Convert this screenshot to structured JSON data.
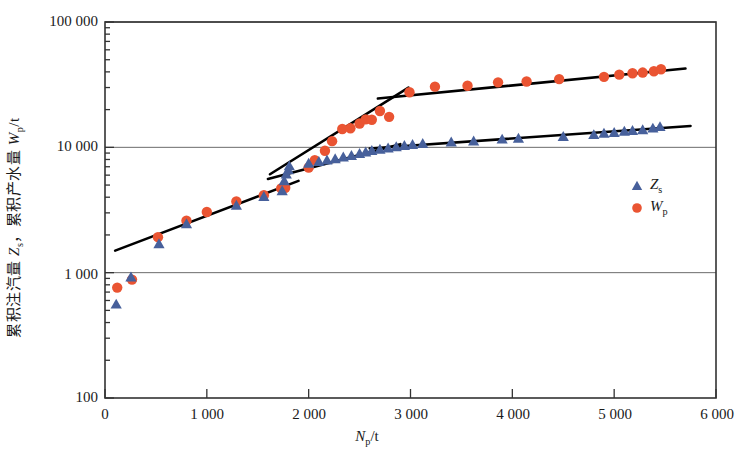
{
  "chart_data": {
    "type": "scatter",
    "title": "",
    "xlabel": "Np/t",
    "ylabel": "累积注汽量 Zs，累积产水量 Wp/t",
    "xlabel_main": "N",
    "xlabel_sub": "p",
    "xlabel_unit": "/t",
    "yscale": "log",
    "xscale": "linear",
    "xlim": [
      0,
      6000
    ],
    "ylim": [
      100,
      100000
    ],
    "grid": "horizontal-major",
    "legend_position": "inside-right",
    "xticks": [
      "0",
      "1 000",
      "2 000",
      "3 000",
      "4 000",
      "5 000",
      "6 000"
    ],
    "xtick_values": [
      0,
      1000,
      2000,
      3000,
      4000,
      5000,
      6000
    ],
    "yticks": [
      "100",
      "1 000",
      "10 000",
      "100 000"
    ],
    "ytick_values": [
      100,
      1000,
      10000,
      100000
    ],
    "colors": {
      "series_zs": "#47609b",
      "series_wp": "#ea5432",
      "fitline": "#000000",
      "axis": "#333333",
      "grid": "#6b6b6b"
    },
    "legend": [
      {
        "label_main": "Z",
        "label_sub": "s",
        "marker": "triangle",
        "color": "#47609b"
      },
      {
        "label_main": "W",
        "label_sub": "p",
        "marker": "circle",
        "color": "#ea5432"
      }
    ],
    "series": [
      {
        "name": "Zs",
        "marker": "triangle",
        "color": "#47609b",
        "points": [
          [
            110,
            560
          ],
          [
            255,
            920
          ],
          [
            530,
            1700
          ],
          [
            800,
            2450
          ],
          [
            1290,
            3450
          ],
          [
            1560,
            4050
          ],
          [
            1740,
            4500
          ],
          [
            1760,
            5400
          ],
          [
            1780,
            6100
          ],
          [
            1800,
            6600
          ],
          [
            1810,
            7100
          ],
          [
            2000,
            7450
          ],
          [
            2100,
            7700
          ],
          [
            2180,
            7900
          ],
          [
            2260,
            8100
          ],
          [
            2340,
            8350
          ],
          [
            2420,
            8600
          ],
          [
            2500,
            8900
          ],
          [
            2560,
            9150
          ],
          [
            2620,
            9400
          ],
          [
            2700,
            9650
          ],
          [
            2780,
            9850
          ],
          [
            2860,
            10100
          ],
          [
            2940,
            10300
          ],
          [
            3020,
            10500
          ],
          [
            3120,
            10700
          ],
          [
            3400,
            11000
          ],
          [
            3620,
            11200
          ],
          [
            3900,
            11600
          ],
          [
            4060,
            11800
          ],
          [
            4500,
            12200
          ],
          [
            4800,
            12600
          ],
          [
            4900,
            12900
          ],
          [
            5000,
            13100
          ],
          [
            5100,
            13400
          ],
          [
            5180,
            13600
          ],
          [
            5280,
            13800
          ],
          [
            5380,
            14200
          ],
          [
            5450,
            14600
          ]
        ]
      },
      {
        "name": "Wp",
        "marker": "circle",
        "color": "#ea5432",
        "points": [
          [
            120,
            760
          ],
          [
            265,
            880
          ],
          [
            520,
            1920
          ],
          [
            800,
            2600
          ],
          [
            1000,
            3050
          ],
          [
            1290,
            3700
          ],
          [
            1560,
            4150
          ],
          [
            1730,
            4700
          ],
          [
            1770,
            4750
          ],
          [
            2000,
            6900
          ],
          [
            2060,
            7900
          ],
          [
            2160,
            9400
          ],
          [
            2230,
            11200
          ],
          [
            2330,
            14000
          ],
          [
            2410,
            14200
          ],
          [
            2500,
            15500
          ],
          [
            2560,
            16700
          ],
          [
            2620,
            16600
          ],
          [
            2700,
            19500
          ],
          [
            2790,
            17500
          ],
          [
            2990,
            27500
          ],
          [
            3240,
            30500
          ],
          [
            3560,
            31000
          ],
          [
            3860,
            33000
          ],
          [
            4140,
            33500
          ],
          [
            4460,
            35000
          ],
          [
            4900,
            36500
          ],
          [
            5050,
            38000
          ],
          [
            5180,
            39000
          ],
          [
            5280,
            39500
          ],
          [
            5390,
            40500
          ],
          [
            5460,
            42000
          ]
        ]
      }
    ],
    "fit_lines": [
      {
        "name": "wp-segment-1",
        "x1": 100,
        "y1": 1500,
        "x2": 1900,
        "y2": 5400
      },
      {
        "name": "wp-segment-2",
        "x1": 1620,
        "y1": 6100,
        "x2": 2980,
        "y2": 30000
      },
      {
        "name": "wp-segment-3",
        "x1": 2680,
        "y1": 24500,
        "x2": 5700,
        "y2": 42500
      },
      {
        "name": "zs-segment-1",
        "x1": 1600,
        "y1": 5600,
        "x2": 2900,
        "y2": 10600
      },
      {
        "name": "zs-segment-2",
        "x1": 2600,
        "y1": 9800,
        "x2": 5750,
        "y2": 14800
      }
    ]
  }
}
